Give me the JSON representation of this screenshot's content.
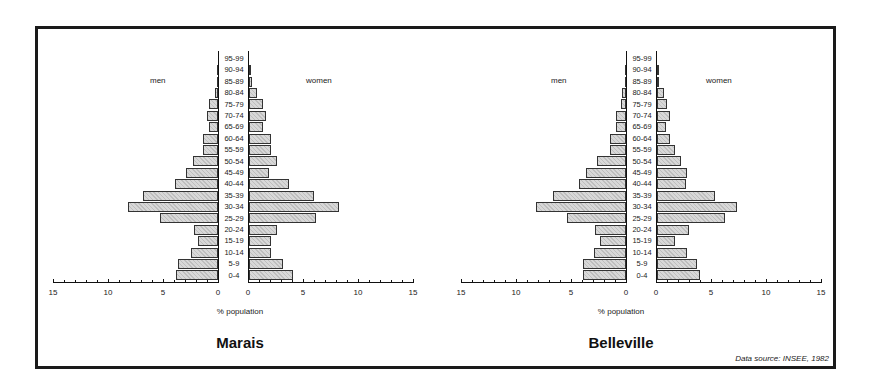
{
  "chart_data": [
    {
      "type": "bar",
      "subtype": "population-pyramid",
      "title": "Marais",
      "xlabel": "% population",
      "ylabel": "",
      "xlim": [
        0,
        15
      ],
      "x_ticks": [
        15,
        10,
        5,
        0,
        0,
        5,
        10,
        15
      ],
      "left_label": "men",
      "right_label": "women",
      "categories": [
        "0-4",
        "5-9",
        "10-14",
        "15-19",
        "20-24",
        "25-29",
        "30-34",
        "35-39",
        "40-44",
        "45-49",
        "50-54",
        "55-59",
        "60-64",
        "65-69",
        "70-74",
        "75-79",
        "80-84",
        "85-89",
        "90-94",
        "95-99"
      ],
      "series": [
        {
          "name": "men",
          "values": [
            3.8,
            3.6,
            2.5,
            1.8,
            2.2,
            5.3,
            8.2,
            6.8,
            3.9,
            2.9,
            2.3,
            1.4,
            1.4,
            0.8,
            1.0,
            0.8,
            0.3,
            0.1,
            0.1,
            0.0
          ]
        },
        {
          "name": "women",
          "values": [
            4.0,
            3.1,
            2.0,
            2.0,
            2.5,
            6.1,
            8.2,
            5.9,
            3.6,
            1.8,
            2.5,
            2.0,
            2.0,
            1.3,
            1.5,
            1.3,
            0.7,
            0.3,
            0.1,
            0.0
          ]
        }
      ],
      "grid": false
    },
    {
      "type": "bar",
      "subtype": "population-pyramid",
      "title": "Belleville",
      "xlabel": "% population",
      "ylabel": "",
      "xlim": [
        0,
        15
      ],
      "x_ticks": [
        15,
        10,
        5,
        0,
        0,
        5,
        10,
        15
      ],
      "left_label": "men",
      "right_label": "women",
      "categories": [
        "0-4",
        "5-9",
        "10-14",
        "15-19",
        "20-24",
        "25-29",
        "30-34",
        "35-39",
        "40-44",
        "45-49",
        "50-54",
        "55-59",
        "60-64",
        "65-69",
        "70-74",
        "75-79",
        "80-84",
        "85-89",
        "90-94",
        "95-99"
      ],
      "series": [
        {
          "name": "men",
          "values": [
            3.9,
            3.9,
            2.9,
            2.4,
            2.8,
            5.4,
            8.2,
            6.6,
            4.3,
            3.6,
            2.6,
            1.5,
            1.5,
            0.9,
            0.9,
            0.5,
            0.4,
            0.1,
            0.1,
            0.0
          ]
        },
        {
          "name": "women",
          "values": [
            3.9,
            3.6,
            2.7,
            1.6,
            2.9,
            6.2,
            7.3,
            5.3,
            2.6,
            2.7,
            2.2,
            1.6,
            1.2,
            0.8,
            1.2,
            0.9,
            0.6,
            0.2,
            0.1,
            0.0
          ]
        }
      ],
      "grid": false
    }
  ],
  "source_note": "Data source: INSEE, 1982"
}
